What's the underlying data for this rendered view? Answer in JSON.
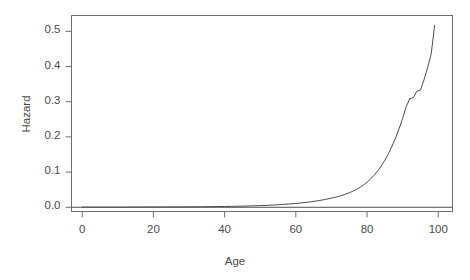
{
  "chart_data": {
    "type": "line",
    "title": "",
    "xlabel": "Age",
    "ylabel": "Hazard",
    "xlim": [
      -3,
      104
    ],
    "ylim": [
      -0.012,
      0.545
    ],
    "grid": false,
    "legend": null,
    "xticks": [
      0,
      20,
      40,
      60,
      80,
      100
    ],
    "xtick_labels": [
      "0",
      "20",
      "40",
      "60",
      "80",
      "100"
    ],
    "yticks": [
      0.0,
      0.1,
      0.2,
      0.3,
      0.4,
      0.5
    ],
    "ytick_labels": [
      "0.0",
      "0.1",
      "0.2",
      "0.3",
      "0.4",
      "0.5"
    ],
    "series": [
      {
        "name": "hazard",
        "color": "#4d4d4d",
        "x": [
          0,
          1,
          2,
          3,
          4,
          5,
          6,
          7,
          8,
          9,
          10,
          12,
          14,
          16,
          18,
          20,
          22,
          24,
          26,
          28,
          30,
          32,
          34,
          36,
          38,
          40,
          42,
          44,
          46,
          48,
          50,
          52,
          54,
          56,
          58,
          60,
          62,
          64,
          66,
          68,
          70,
          71,
          72,
          73,
          74,
          75,
          76,
          77,
          78,
          79,
          80,
          81,
          82,
          83,
          84,
          85,
          86,
          87,
          88,
          89,
          90,
          91,
          92,
          93,
          94,
          95,
          96,
          97,
          98,
          99
        ],
        "y": [
          0.0008,
          0.0006,
          0.0005,
          0.0004,
          0.0004,
          0.0004,
          0.0004,
          0.0004,
          0.0004,
          0.0004,
          0.0004,
          0.0005,
          0.0006,
          0.0007,
          0.0008,
          0.0009,
          0.001,
          0.001,
          0.0011,
          0.0012,
          0.0013,
          0.0014,
          0.0016,
          0.0018,
          0.002,
          0.0023,
          0.0026,
          0.003,
          0.0035,
          0.0041,
          0.0048,
          0.0056,
          0.0066,
          0.0078,
          0.0092,
          0.0109,
          0.0129,
          0.0153,
          0.0182,
          0.0217,
          0.0259,
          0.0283,
          0.031,
          0.034,
          0.0374,
          0.0412,
          0.0456,
          0.0507,
          0.0566,
          0.0634,
          0.0713,
          0.0805,
          0.0912,
          0.1035,
          0.1176,
          0.1338,
          0.1523,
          0.1732,
          0.1968,
          0.2232,
          0.2527,
          0.2855,
          0.3085,
          0.3115,
          0.33,
          0.333,
          0.362,
          0.396,
          0.435,
          0.518
        ]
      },
      {
        "name": "zero-reference",
        "color": "#4d4d4d",
        "x": [
          -3,
          104
        ],
        "y": [
          0.0,
          0.0
        ]
      }
    ]
  },
  "axes": {
    "x_title": "Age",
    "y_title": "Hazard"
  }
}
